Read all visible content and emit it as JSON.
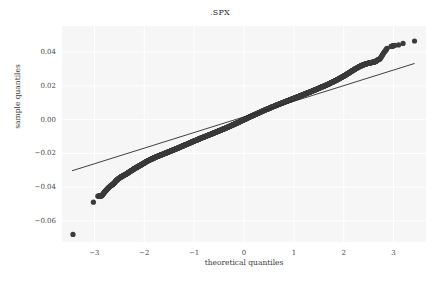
{
  "chart_data": {
    "type": "scatter",
    "title": ".SPX",
    "xlabel": "theoretical quantiles",
    "ylabel": "sample quantiles",
    "xlim": [
      -3.65,
      3.65
    ],
    "ylim": [
      -0.0725,
      0.0555
    ],
    "xticks": [
      -3,
      -2,
      -1,
      0,
      1,
      2,
      3
    ],
    "xticklabels": [
      "−3",
      "−2",
      "−1",
      "0",
      "1",
      "2",
      "3"
    ],
    "yticks": [
      0.04,
      0.02,
      0.0,
      -0.02,
      -0.04,
      -0.06
    ],
    "yticklabels": [
      "0.04",
      "0.02",
      "0.00",
      "−0.02",
      "−0.04",
      "−0.06"
    ],
    "grid": true,
    "grid_color": "#ffffff",
    "axes_facecolor": "#f6f6f6",
    "figure_facecolor": "#ffffff",
    "marker_color": "#3b3b3b",
    "marker_size": 2.6,
    "line_color": "#2a2a2a",
    "legend": null,
    "reference_line": {
      "name": "45-degree fit line",
      "x0": -3.45,
      "y0": -0.0303,
      "x1": 3.42,
      "y1": 0.0333
    },
    "series": [
      {
        "name": "sample quantiles",
        "points": [
          [
            -3.43,
            -0.068
          ],
          [
            -3.02,
            -0.0489
          ],
          [
            -2.93,
            -0.0453
          ],
          [
            -2.88,
            -0.0452
          ],
          [
            -2.85,
            -0.045
          ],
          [
            -2.8,
            -0.043
          ],
          [
            -2.76,
            -0.0417
          ],
          [
            -2.72,
            -0.0404
          ],
          [
            -2.68,
            -0.0393
          ],
          [
            -2.64,
            -0.0385
          ],
          [
            -2.61,
            -0.0378
          ],
          [
            -2.57,
            -0.0363
          ],
          [
            -2.54,
            -0.0355
          ],
          [
            -2.5,
            -0.0346
          ],
          [
            -2.47,
            -0.034
          ],
          [
            -2.44,
            -0.0335
          ],
          [
            -2.41,
            -0.033
          ],
          [
            -2.38,
            -0.0325
          ],
          [
            -2.35,
            -0.032
          ],
          [
            -2.32,
            -0.0314
          ],
          [
            -2.29,
            -0.0308
          ],
          [
            -2.26,
            -0.0302
          ],
          [
            -2.23,
            -0.0297
          ],
          [
            -2.21,
            -0.0292
          ],
          [
            -2.18,
            -0.0287
          ],
          [
            -2.15,
            -0.0283
          ],
          [
            -2.13,
            -0.0278
          ],
          [
            -2.1,
            -0.0274
          ],
          [
            -2.08,
            -0.027
          ],
          [
            -2.05,
            -0.0266
          ],
          [
            -2.03,
            -0.0261
          ],
          [
            -2.0,
            -0.0257
          ],
          [
            -1.98,
            -0.0252
          ],
          [
            -1.95,
            -0.0248
          ],
          [
            -1.93,
            -0.0244
          ],
          [
            -1.9,
            -0.024
          ],
          [
            -1.88,
            -0.0236
          ],
          [
            -1.85,
            -0.0233
          ],
          [
            -1.83,
            -0.023
          ],
          [
            -1.8,
            -0.0226
          ],
          [
            -1.78,
            -0.0223
          ],
          [
            -1.75,
            -0.0219
          ],
          [
            -1.72,
            -0.0216
          ],
          [
            -1.7,
            -0.0213
          ],
          [
            -1.67,
            -0.021
          ],
          [
            -1.65,
            -0.0207
          ],
          [
            -1.62,
            -0.0204
          ],
          [
            -1.6,
            -0.0201
          ],
          [
            -1.57,
            -0.0198
          ],
          [
            -1.55,
            -0.0195
          ],
          [
            -1.52,
            -0.0192
          ],
          [
            -1.5,
            -0.0189
          ],
          [
            -1.47,
            -0.0186
          ],
          [
            -1.45,
            -0.0183
          ],
          [
            -1.42,
            -0.018
          ],
          [
            -1.4,
            -0.0177
          ],
          [
            -1.37,
            -0.0174
          ],
          [
            -1.35,
            -0.0171
          ],
          [
            -1.32,
            -0.0168
          ],
          [
            -1.3,
            -0.0165
          ],
          [
            -1.27,
            -0.0161
          ],
          [
            -1.25,
            -0.0158
          ],
          [
            -1.22,
            -0.0155
          ],
          [
            -1.2,
            -0.0152
          ],
          [
            -1.17,
            -0.0148
          ],
          [
            -1.14,
            -0.0145
          ],
          [
            -1.12,
            -0.0142
          ],
          [
            -1.09,
            -0.0138
          ],
          [
            -1.06,
            -0.0135
          ],
          [
            -1.04,
            -0.0131
          ],
          [
            -1.01,
            -0.0128
          ],
          [
            -0.98,
            -0.0124
          ],
          [
            -0.95,
            -0.0121
          ],
          [
            -0.92,
            -0.0117
          ],
          [
            -0.9,
            -0.0114
          ],
          [
            -0.87,
            -0.011
          ],
          [
            -0.84,
            -0.0107
          ],
          [
            -0.81,
            -0.0103
          ],
          [
            -0.78,
            -0.01
          ],
          [
            -0.75,
            -0.0096
          ],
          [
            -0.72,
            -0.0093
          ],
          [
            -0.69,
            -0.0089
          ],
          [
            -0.66,
            -0.0086
          ],
          [
            -0.63,
            -0.0082
          ],
          [
            -0.6,
            -0.0078
          ],
          [
            -0.57,
            -0.0075
          ],
          [
            -0.54,
            -0.0071
          ],
          [
            -0.51,
            -0.0067
          ],
          [
            -0.48,
            -0.0064
          ],
          [
            -0.45,
            -0.006
          ],
          [
            -0.42,
            -0.0056
          ],
          [
            -0.39,
            -0.0053
          ],
          [
            -0.36,
            -0.0049
          ],
          [
            -0.33,
            -0.0045
          ],
          [
            -0.3,
            -0.0041
          ],
          [
            -0.27,
            -0.0037
          ],
          [
            -0.24,
            -0.0033
          ],
          [
            -0.21,
            -0.0029
          ],
          [
            -0.18,
            -0.0025
          ],
          [
            -0.15,
            -0.0021
          ],
          [
            -0.12,
            -0.0017
          ],
          [
            -0.09,
            -0.0013
          ],
          [
            -0.06,
            -0.0008
          ],
          [
            -0.03,
            -0.0004
          ],
          [
            0.0,
            0.0
          ],
          [
            0.03,
            0.0004
          ],
          [
            0.06,
            0.0008
          ],
          [
            0.09,
            0.0013
          ],
          [
            0.12,
            0.0017
          ],
          [
            0.15,
            0.0021
          ],
          [
            0.18,
            0.0025
          ],
          [
            0.21,
            0.0029
          ],
          [
            0.24,
            0.0033
          ],
          [
            0.27,
            0.0037
          ],
          [
            0.3,
            0.0041
          ],
          [
            0.33,
            0.0045
          ],
          [
            0.36,
            0.0049
          ],
          [
            0.39,
            0.0053
          ],
          [
            0.42,
            0.0057
          ],
          [
            0.45,
            0.0061
          ],
          [
            0.48,
            0.0064
          ],
          [
            0.51,
            0.0068
          ],
          [
            0.54,
            0.0072
          ],
          [
            0.57,
            0.0076
          ],
          [
            0.6,
            0.0079
          ],
          [
            0.63,
            0.0083
          ],
          [
            0.66,
            0.0087
          ],
          [
            0.69,
            0.009
          ],
          [
            0.72,
            0.0094
          ],
          [
            0.75,
            0.0097
          ],
          [
            0.78,
            0.0101
          ],
          [
            0.81,
            0.0104
          ],
          [
            0.84,
            0.0108
          ],
          [
            0.87,
            0.0111
          ],
          [
            0.9,
            0.0115
          ],
          [
            0.93,
            0.0118
          ],
          [
            0.96,
            0.0122
          ],
          [
            0.99,
            0.0125
          ],
          [
            1.02,
            0.0129
          ],
          [
            1.05,
            0.0132
          ],
          [
            1.08,
            0.0136
          ],
          [
            1.11,
            0.0139
          ],
          [
            1.14,
            0.0143
          ],
          [
            1.17,
            0.0146
          ],
          [
            1.2,
            0.015
          ],
          [
            1.23,
            0.0153
          ],
          [
            1.26,
            0.0157
          ],
          [
            1.29,
            0.016
          ],
          [
            1.32,
            0.0164
          ],
          [
            1.35,
            0.0167
          ],
          [
            1.38,
            0.0171
          ],
          [
            1.41,
            0.0175
          ],
          [
            1.44,
            0.0178
          ],
          [
            1.47,
            0.0182
          ],
          [
            1.5,
            0.0186
          ],
          [
            1.53,
            0.019
          ],
          [
            1.56,
            0.0194
          ],
          [
            1.59,
            0.0197
          ],
          [
            1.62,
            0.0201
          ],
          [
            1.65,
            0.0205
          ],
          [
            1.68,
            0.0209
          ],
          [
            1.71,
            0.0213
          ],
          [
            1.74,
            0.0218
          ],
          [
            1.77,
            0.0222
          ],
          [
            1.8,
            0.0226
          ],
          [
            1.83,
            0.0231
          ],
          [
            1.86,
            0.0235
          ],
          [
            1.89,
            0.024
          ],
          [
            1.92,
            0.0245
          ],
          [
            1.95,
            0.025
          ],
          [
            1.98,
            0.0255
          ],
          [
            2.01,
            0.026
          ],
          [
            2.04,
            0.0265
          ],
          [
            2.07,
            0.0271
          ],
          [
            2.1,
            0.0276
          ],
          [
            2.13,
            0.0282
          ],
          [
            2.16,
            0.0288
          ],
          [
            2.19,
            0.0293
          ],
          [
            2.22,
            0.0299
          ],
          [
            2.25,
            0.0304
          ],
          [
            2.28,
            0.0309
          ],
          [
            2.31,
            0.0314
          ],
          [
            2.34,
            0.0318
          ],
          [
            2.37,
            0.0322
          ],
          [
            2.4,
            0.0326
          ],
          [
            2.43,
            0.0329
          ],
          [
            2.46,
            0.0332
          ],
          [
            2.49,
            0.0334
          ],
          [
            2.52,
            0.0336
          ],
          [
            2.55,
            0.0338
          ],
          [
            2.58,
            0.034
          ],
          [
            2.61,
            0.0342
          ],
          [
            2.64,
            0.0345
          ],
          [
            2.67,
            0.0352
          ],
          [
            2.73,
            0.0361
          ],
          [
            2.8,
            0.0395
          ],
          [
            2.87,
            0.0423
          ],
          [
            2.95,
            0.0434
          ],
          [
            3.02,
            0.044
          ],
          [
            3.1,
            0.0443
          ],
          [
            3.19,
            0.0452
          ],
          [
            3.42,
            0.0466
          ]
        ]
      }
    ]
  }
}
